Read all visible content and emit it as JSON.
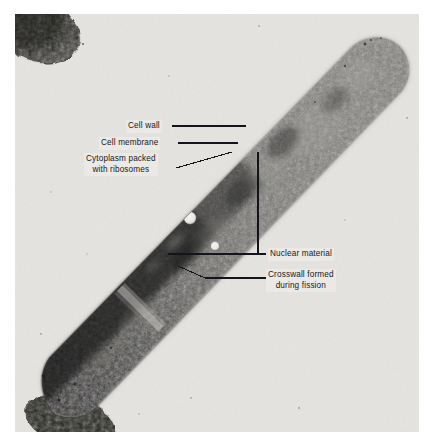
{
  "figure": {
    "kind": "annotated-electron-micrograph",
    "plate": {
      "background_color": "#e7e6e2",
      "page_background_color": "#ffffff"
    },
    "cell": {
      "body_color_light": "#8e8c88",
      "body_color_mid": "#6a6864",
      "body_color_dark": "#3a3936",
      "body_color_darkest": "#23221f",
      "orientation": "lower-left to upper-right diagonal"
    }
  },
  "annotations": {
    "leader_line_color": "#14151a",
    "items": [
      {
        "id": "cell-wall",
        "text": "Cell wall",
        "align": "right",
        "lines": [
          "Cell wall"
        ]
      },
      {
        "id": "cell-membrane",
        "text": "Cell membrane",
        "align": "right",
        "lines": [
          "Cell membrane"
        ]
      },
      {
        "id": "cytoplasm",
        "text": "Cytoplasm packed with ribosomes",
        "align": "center",
        "lines": [
          "Cytoplasm packed",
          "with ribosomes"
        ]
      },
      {
        "id": "nuclear-material",
        "text": "Nuclear material",
        "align": "left",
        "lines": [
          "Nuclear material"
        ]
      },
      {
        "id": "crosswall",
        "text": "Crosswall formed during fission",
        "align": "center",
        "lines": [
          "Crosswall formed",
          "during fission"
        ]
      }
    ],
    "labels": {
      "cell_wall": "Cell wall",
      "cell_membrane": "Cell membrane",
      "cytoplasm_line1": "Cytoplasm packed",
      "cytoplasm_line2": "with ribosomes",
      "nuclear_material": "Nuclear material",
      "crosswall_line1": "Crosswall formed",
      "crosswall_line2": "during fission"
    }
  },
  "features": {
    "nuclear_material_vacuoles": [
      {
        "cx": 190,
        "cy": 219,
        "r": 6.2
      },
      {
        "cx": 215,
        "cy": 247,
        "r": 4.4
      }
    ],
    "corner_fragment": {
      "description": "dark cell fragment at top-left corner of plate"
    },
    "bottom_fragment": {
      "description": "dark cell fragment at bottom-left edge of plate"
    }
  }
}
